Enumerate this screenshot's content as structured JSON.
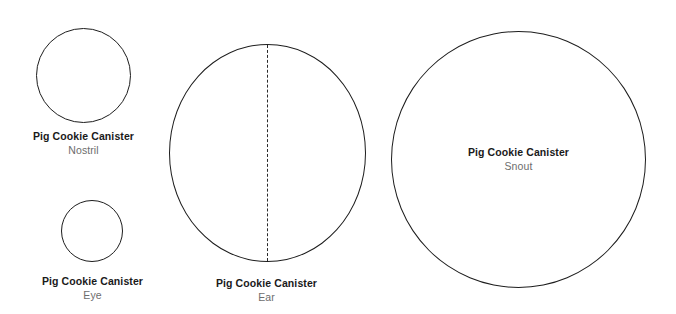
{
  "sheet": {
    "background_color": "#ffffff",
    "outline_color": "#1d1d1d",
    "title_color": "#1a1a1a",
    "subtitle_color": "#6d6d6d"
  },
  "pieces": [
    {
      "id": "nostril",
      "title": "Pig Cookie Canister",
      "subtitle": "Nostril",
      "shape": "circle",
      "fold_line": false
    },
    {
      "id": "eye",
      "title": "Pig Cookie Canister",
      "subtitle": "Eye",
      "shape": "circle",
      "fold_line": false
    },
    {
      "id": "ear",
      "title": "Pig Cookie Canister",
      "subtitle": "Ear",
      "shape": "circle",
      "fold_line": true
    },
    {
      "id": "snout",
      "title": "Pig Cookie Canister",
      "subtitle": "Snout",
      "shape": "circle",
      "fold_line": false
    }
  ]
}
